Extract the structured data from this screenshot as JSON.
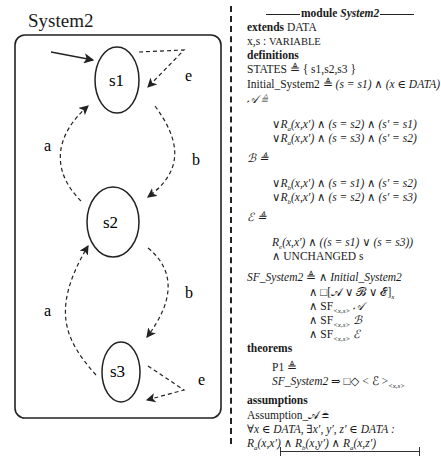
{
  "diagram": {
    "title": "System2",
    "states": [
      {
        "id": "s1",
        "label": "s1"
      },
      {
        "id": "s2",
        "label": "s2"
      },
      {
        "id": "s3",
        "label": "s3"
      }
    ],
    "transitions": [
      {
        "from": "init",
        "to": "s1",
        "label": "",
        "style": "solid"
      },
      {
        "from": "s1",
        "to": "s1",
        "label": "e",
        "style": "dashed"
      },
      {
        "from": "s1",
        "to": "s2",
        "label": "b",
        "style": "dashed"
      },
      {
        "from": "s2",
        "to": "s1",
        "label": "a",
        "style": "dashed"
      },
      {
        "from": "s2",
        "to": "s3",
        "label": "b",
        "style": "dashed"
      },
      {
        "from": "s3",
        "to": "s2",
        "label": "a",
        "style": "dashed"
      },
      {
        "from": "s3",
        "to": "s3",
        "label": "e",
        "style": "dashed"
      }
    ]
  },
  "spec": {
    "module_keyword": "module",
    "module_name": "System2",
    "extends_kw": "extends",
    "extends_val": "DATA",
    "vars": "x,s",
    "vars_kw": "VARIABLE",
    "definitions_kw": "definitions",
    "states_def": "STATES ≜ { s1,s2,s3 }",
    "init_def_name": "Initial_System2 ≜ ",
    "init_def_body": "(s = s1) ∧ (x ∈ DATA)",
    "A_def": "𝒜 ≜",
    "A_lines": [
      "∨R",
      "∨R"
    ],
    "A_line1": "(x,x′) ∧ (s = s2) ∧ (s′ = s1)",
    "A_line2": "(x,x′) ∧ (s = s3) ∧ (s′ = s2)",
    "B_def": "ℬ ≜",
    "B_line1": "(x,x′) ∧ (s = s1) ∧ (s′ = s2)",
    "B_line2": "(x,x′) ∧ (s = s2) ∧ (s′ = s3)",
    "E_def": "ℰ ≜",
    "E_line1": "(x,x′) ∧ ((s = s1) ∨ (s = s3))",
    "E_line2": "∧ UNCHANGED s",
    "sf_name": "SF_System2",
    "sf_def": " ≜ ",
    "sf_l1": "∧ ",
    "sf_l1_it": "Initial_System2",
    "sf_l2": "∧ □[𝒜 ∨ ℬ ∨ ℰ]",
    "sf_l2_sub": "x",
    "sf_l3": "∧ SF",
    "sf_sub": "<x,s>",
    "sf_l3_tail": " 𝒜",
    "sf_l4_tail": " ℬ",
    "sf_l5_tail": " ℰ",
    "theorems_kw": "theorems",
    "p1": "P1 ≜",
    "p1_body_it": "SF_System2",
    "p1_body": " ⇒ □◇ < ℰ >",
    "p1_sub": "<x,s>",
    "assumptions_kw": "assumptions",
    "assump_name": "Assumption_𝒜 ≜",
    "assump_l1": "∀x ∈ DATA, ∃x′, y′, z′ ∈ DATA :",
    "assump_l2": "R",
    "assump_l2_a": "a",
    "assump_l2_rest1": "(x,x′) ∧ R",
    "assump_l2_b": "b",
    "assump_l2_rest2": "(x,y′) ∧ R",
    "assump_l2_rest3": "(x,z′)",
    "sub_a": "a",
    "sub_b": "b",
    "sub_e": "e"
  }
}
